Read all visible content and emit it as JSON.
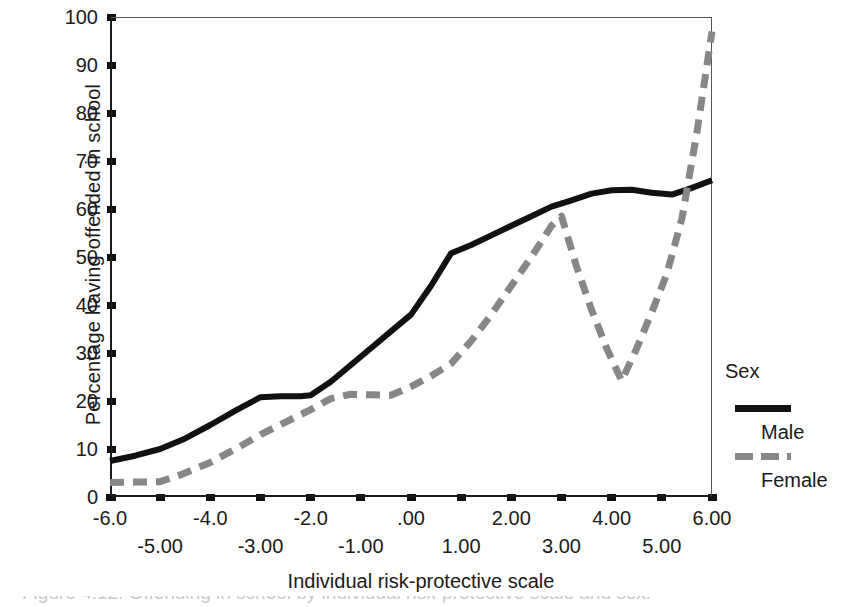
{
  "chart_data": {
    "type": "line",
    "title": "",
    "xlabel": "Individual risk-protective scale",
    "ylabel": "Percentage having offended in school",
    "xlim": [
      -6,
      6
    ],
    "ylim": [
      0,
      100
    ],
    "grid": false,
    "legend_position": "right",
    "legend_title": "Sex",
    "y_ticks": [
      100,
      90,
      80,
      70,
      60,
      50,
      40,
      30,
      20,
      10,
      0
    ],
    "x_ticks_upper": [
      "-6.0",
      "-4.0",
      "-2.0",
      ".00",
      "2.00",
      "4.00",
      "6.00"
    ],
    "x_ticks_upper_values": [
      -6,
      -4,
      -2,
      0,
      2,
      4,
      6
    ],
    "x_ticks_lower": [
      "-5.00",
      "-3.00",
      "-1.00",
      "1.00",
      "3.00",
      "5.00"
    ],
    "x_ticks_lower_values": [
      -5,
      -3,
      -1,
      1,
      3,
      5
    ],
    "series": [
      {
        "name": "Male",
        "color": "#111111",
        "style": "solid",
        "x": [
          -6.0,
          -5.5,
          -5.0,
          -4.5,
          -4.0,
          -3.5,
          -3.0,
          -2.6,
          -2.2,
          -2.0,
          -1.6,
          -1.2,
          -0.8,
          -0.4,
          0.0,
          0.4,
          0.8,
          1.2,
          1.6,
          2.0,
          2.4,
          2.8,
          3.2,
          3.6,
          4.0,
          4.4,
          4.8,
          5.2,
          5.6,
          6.0
        ],
        "y": [
          7.5,
          8.6,
          10.0,
          12.2,
          15.0,
          18.0,
          20.8,
          21.0,
          21.0,
          21.2,
          24.0,
          27.5,
          31.0,
          34.5,
          38.0,
          44.0,
          50.8,
          52.5,
          54.5,
          56.5,
          58.5,
          60.5,
          61.8,
          63.2,
          63.9,
          64.0,
          63.4,
          63.0,
          64.4,
          66.0
        ]
      },
      {
        "name": "Female",
        "color": "#878787",
        "style": "dashed",
        "x": [
          -6.0,
          -5.5,
          -5.0,
          -4.6,
          -4.0,
          -3.5,
          -3.0,
          -2.5,
          -2.0,
          -1.6,
          -1.2,
          -0.8,
          -0.4,
          0.0,
          0.4,
          0.8,
          1.2,
          1.6,
          2.0,
          2.4,
          2.8,
          3.0,
          3.3,
          3.6,
          3.9,
          4.2,
          4.5,
          4.8,
          5.1,
          5.4,
          5.7,
          6.0
        ],
        "y": [
          3.0,
          3.1,
          3.2,
          4.6,
          7.2,
          10.0,
          13.0,
          15.6,
          18.2,
          20.5,
          21.4,
          21.3,
          21.2,
          23.0,
          25.2,
          27.8,
          32.5,
          38.0,
          44.0,
          50.0,
          56.5,
          58.5,
          48.0,
          39.0,
          31.0,
          24.2,
          31.0,
          38.5,
          46.5,
          58.0,
          76.0,
          97.0
        ]
      }
    ]
  },
  "legend": {
    "title": "Sex",
    "entries": [
      {
        "label": "Male",
        "swatch": "solid-black-line"
      },
      {
        "label": "Female",
        "swatch": "dashed-gray-line"
      }
    ]
  },
  "caption": {
    "text": "Figure 4.12. Offending in school by individual risk-protective scale and sex."
  }
}
